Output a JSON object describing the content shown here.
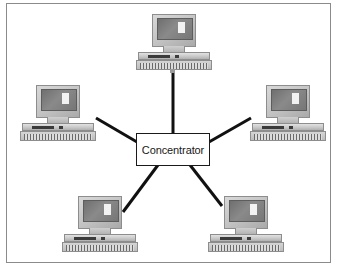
{
  "diagram": {
    "type": "network-topology",
    "topology_name": "star",
    "hub": {
      "label": "Concentrator",
      "shape": "rectangle",
      "x": 136,
      "y": 133,
      "width": 74,
      "height": 33,
      "fill_color": "#ffffff",
      "border_color": "#1a1a1a"
    },
    "nodes": [
      {
        "id": "pc-top",
        "icon": "desktop-computer-icon",
        "x": 136,
        "y": 14,
        "label": ""
      },
      {
        "id": "pc-left",
        "icon": "desktop-computer-icon",
        "x": 20,
        "y": 85,
        "label": ""
      },
      {
        "id": "pc-right",
        "icon": "desktop-computer-icon",
        "x": 250,
        "y": 85,
        "label": ""
      },
      {
        "id": "pc-bottom-left",
        "icon": "desktop-computer-icon",
        "x": 62,
        "y": 196,
        "label": ""
      },
      {
        "id": "pc-bottom-right",
        "icon": "desktop-computer-icon",
        "x": 208,
        "y": 196,
        "label": ""
      }
    ],
    "links": [
      {
        "from": "hub",
        "to": "pc-top",
        "x1": 173,
        "y1": 133,
        "x2": 173,
        "y2": 70
      },
      {
        "from": "hub",
        "to": "pc-left",
        "x1": 136,
        "y1": 142,
        "x2": 96,
        "y2": 118
      },
      {
        "from": "hub",
        "to": "pc-right",
        "x1": 210,
        "y1": 142,
        "x2": 250,
        "y2": 118
      },
      {
        "from": "hub",
        "to": "pc-bottom-left",
        "x1": 158,
        "y1": 166,
        "x2": 123,
        "y2": 211
      },
      {
        "from": "hub",
        "to": "pc-bottom-right",
        "x1": 190,
        "y1": 166,
        "x2": 221,
        "y2": 206
      }
    ],
    "link_color": "#111111",
    "link_width": 3,
    "frame": {
      "border_color": "#8b8b8b",
      "background_color": "#ffffff"
    },
    "background_color": "#ffffff"
  }
}
